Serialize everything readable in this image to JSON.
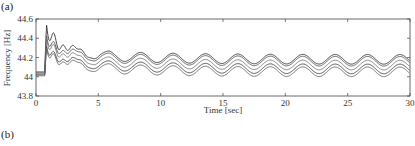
{
  "panels": {
    "a": "(a)",
    "b": "(b)"
  },
  "chart_data": {
    "type": "line",
    "title": "",
    "xlabel": "Time [sec]",
    "ylabel": "Frequency [Hz]",
    "xlim": [
      0,
      30
    ],
    "ylim": [
      43.8,
      44.6
    ],
    "xticks": [
      0,
      5,
      10,
      15,
      20,
      25,
      30
    ],
    "yticks": [
      43.8,
      44,
      44.2,
      44.4,
      44.6
    ],
    "ytick_labels": [
      "43.8",
      "44",
      "44.2",
      "44.4",
      "44.6"
    ],
    "xtick_labels": [
      "0",
      "5",
      "10",
      "15",
      "20",
      "25",
      "30"
    ],
    "grid": false,
    "legend": null,
    "oscillation_period_sec": 2.6,
    "series": [
      {
        "name": "trace-1",
        "initial": 44.05,
        "step_time": 0.7,
        "peak": 44.57,
        "center": 44.18,
        "amplitude": 0.05,
        "color": "#333333"
      },
      {
        "name": "trace-2",
        "initial": 44.04,
        "step_time": 0.7,
        "peak": 44.42,
        "center": 44.16,
        "amplitude": 0.05,
        "color": "#555555"
      },
      {
        "name": "trace-3",
        "initial": 44.03,
        "step_time": 0.7,
        "peak": 44.4,
        "center": 44.12,
        "amplitude": 0.05,
        "color": "#777777"
      },
      {
        "name": "trace-4",
        "initial": 44.02,
        "step_time": 0.7,
        "peak": 44.3,
        "center": 44.08,
        "amplitude": 0.05,
        "color": "#444444"
      },
      {
        "name": "trace-5",
        "initial": 44.01,
        "step_time": 0.7,
        "peak": 44.28,
        "center": 44.05,
        "amplitude": 0.05,
        "color": "#666666"
      }
    ]
  }
}
